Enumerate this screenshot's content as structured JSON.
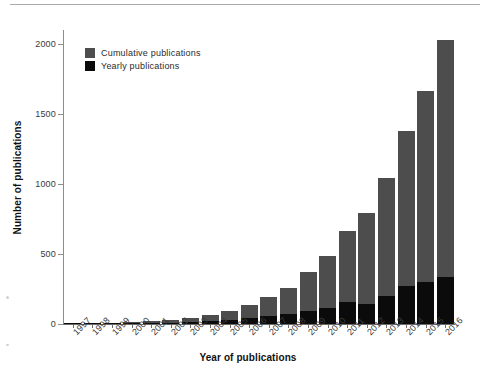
{
  "chart_data": {
    "type": "bar",
    "title": "",
    "subtitle": "",
    "xlabel": "Year of publications",
    "ylabel": "Number of publications",
    "categories": [
      "1997",
      "1998",
      "1999",
      "2000",
      "2001",
      "2002",
      "2003",
      "2004",
      "2005",
      "2006",
      "2007",
      "2008",
      "2009",
      "2010",
      "2011",
      "2012",
      "2013",
      "2014",
      "2015",
      "2016"
    ],
    "series": [
      {
        "name": "Yearly publications",
        "color": "#0b0b0b",
        "values": [
          1,
          3,
          5,
          6,
          8,
          9,
          14,
          20,
          30,
          40,
          55,
          68,
          95,
          115,
          155,
          145,
          200,
          275,
          300,
          335
        ]
      },
      {
        "name": "Cumulative publications",
        "color": "#4d4d4d",
        "values": [
          1,
          4,
          9,
          15,
          23,
          32,
          46,
          66,
          96,
          136,
          191,
          259,
          370,
          487,
          667,
          790,
          1040,
          1380,
          1665,
          2030
        ]
      }
    ],
    "stacking": "cumulative-with-yearly-overlay",
    "ylim": [
      0,
      2100
    ],
    "yticks": [
      0,
      500,
      1000,
      1500,
      2000
    ],
    "ytick_labels": [
      "0",
      "500",
      "1000",
      "1500",
      "2000"
    ],
    "grid": false,
    "legend_position": "top-left",
    "legend_entries": [
      {
        "label": "Cumulative publications",
        "color": "#4d4d4d"
      },
      {
        "label": "Yearly publications",
        "color": "#0b0b0b"
      }
    ],
    "xtick_rotation": -45
  },
  "axes": {
    "y_title": "Number of publications",
    "x_title": "Year of publications"
  }
}
